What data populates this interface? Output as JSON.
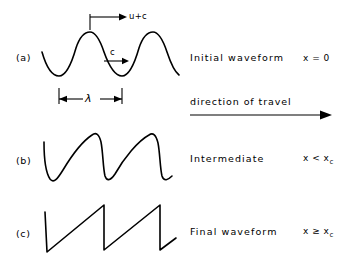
{
  "figure": {
    "background_color": "#ffffff",
    "stroke_color": "#000000"
  },
  "rows": [
    {
      "tag": "(a)",
      "description": "Initial waveform",
      "condition_main": "x = 0",
      "condition_base": "x = 0",
      "condition_sub": "",
      "waveform": "sinusoid"
    },
    {
      "tag": "(b)",
      "description": "Intermediate",
      "condition_main": "x < x",
      "condition_base": "x < x",
      "condition_sub": "c",
      "waveform": "steepened"
    },
    {
      "tag": "(c)",
      "description": "Final waveform",
      "condition_main": "x ≥ x",
      "condition_base": "x ≥ x",
      "condition_sub": "c",
      "waveform": "sawtooth"
    }
  ],
  "annotations": {
    "crest_velocity": "u+c",
    "sound_speed": "c",
    "wavelength": "λ",
    "travel_direction": "direction of travel"
  }
}
